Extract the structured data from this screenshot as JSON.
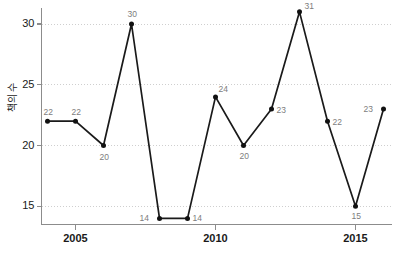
{
  "chart_data": {
    "type": "line",
    "title": "",
    "subtitle": "",
    "xlabel": "",
    "ylabel": "책의 수",
    "x": [
      2004,
      2005,
      2006,
      2007,
      2008,
      2009,
      2010,
      2011,
      2012,
      2013,
      2014,
      2015,
      2016
    ],
    "values": [
      22,
      22,
      20,
      30,
      14,
      14,
      24,
      20,
      23,
      31,
      22,
      15,
      23
    ],
    "point_labels": [
      "22",
      "22",
      "20",
      "30",
      "14",
      "14",
      "24",
      "20",
      "23",
      "31",
      "22",
      "15",
      "23"
    ],
    "series": [
      {
        "name": "책의 수",
        "values": [
          22,
          22,
          20,
          30,
          14,
          14,
          24,
          20,
          23,
          31,
          22,
          15,
          23
        ]
      }
    ],
    "xlim": [
      2003.5,
      2016.5
    ],
    "ylim": [
      13.5,
      31.8
    ],
    "xticks": [
      2005,
      2010,
      2015
    ],
    "xtick_labels": [
      "2005",
      "2010",
      "2015"
    ],
    "yticks": [
      15,
      20,
      25,
      30
    ],
    "ytick_labels": [
      "15",
      "20",
      "25",
      "30"
    ],
    "grid": true,
    "grid_style": "dotted-horizontal",
    "legend": "none",
    "legend_position": "none",
    "colors": {
      "line": "#1a1a1a",
      "marker": "#111111",
      "grid": "#cfcfcf",
      "axis": "#8c8c8c",
      "tick_text": "#1a1a1a",
      "point_label": "#7d7d7d",
      "background": "#ffffff"
    },
    "marker": "circle",
    "line_width": 1.7
  },
  "axes": {
    "y_title": "책의 수",
    "y_ticks": [
      {
        "label": "30",
        "value": 30
      },
      {
        "label": "25",
        "value": 25
      },
      {
        "label": "20",
        "value": 20
      },
      {
        "label": "15",
        "value": 15
      }
    ],
    "x_ticks": [
      {
        "label": "2005",
        "value": 2005
      },
      {
        "label": "2010",
        "value": 2010
      },
      {
        "label": "2015",
        "value": 2015
      }
    ]
  }
}
